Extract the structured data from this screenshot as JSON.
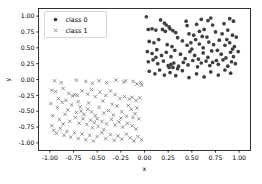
{
  "chart_data": {
    "type": "scatter",
    "title": "",
    "xlabel": "x",
    "ylabel": "y",
    "xlim": [
      -1.12,
      1.12
    ],
    "ylim": [
      -1.12,
      1.12
    ],
    "grid": false,
    "legend_position": "upper left",
    "xticks": [
      -1.0,
      -0.75,
      -0.5,
      -0.25,
      0.0,
      0.25,
      0.5,
      0.75,
      1.0
    ],
    "xticklabels": [
      "-1.00",
      "-0.75",
      "-0.50",
      "-0.25",
      "0.00",
      "0.25",
      "0.50",
      "0.75",
      "1.00"
    ],
    "yticks": [
      -1.0,
      -0.75,
      -0.5,
      -0.25,
      0.0,
      0.25,
      0.5,
      0.75,
      1.0
    ],
    "yticklabels": [
      "-1.00",
      "-0.75",
      "-0.50",
      "-0.25",
      "0.00",
      "0.25",
      "0.50",
      "0.75",
      "1.00"
    ],
    "series": [
      {
        "name": "class 0",
        "marker": "circle",
        "color": "#3f3f3f",
        "size": 12,
        "points": [
          [
            0.02,
            0.99
          ],
          [
            0.17,
            0.94
          ],
          [
            0.21,
            0.89
          ],
          [
            0.23,
            0.86
          ],
          [
            0.26,
            0.83
          ],
          [
            0.44,
            0.92
          ],
          [
            0.6,
            0.95
          ],
          [
            0.67,
            0.93
          ],
          [
            0.7,
            0.97
          ],
          [
            0.9,
            0.96
          ],
          [
            0.94,
            0.92
          ],
          [
            0.04,
            0.79
          ],
          [
            0.08,
            0.8
          ],
          [
            0.12,
            0.78
          ],
          [
            0.19,
            0.79
          ],
          [
            0.22,
            0.76
          ],
          [
            0.27,
            0.8
          ],
          [
            0.3,
            0.77
          ],
          [
            0.33,
            0.74
          ],
          [
            0.47,
            0.72
          ],
          [
            0.52,
            0.7
          ],
          [
            0.58,
            0.76
          ],
          [
            0.63,
            0.79
          ],
          [
            0.66,
            0.67
          ],
          [
            0.75,
            0.75
          ],
          [
            0.82,
            0.72
          ],
          [
            0.88,
            0.78
          ],
          [
            0.93,
            0.7
          ],
          [
            0.97,
            0.67
          ],
          [
            0.05,
            0.6
          ],
          [
            0.1,
            0.58
          ],
          [
            0.15,
            0.63
          ],
          [
            0.24,
            0.55
          ],
          [
            0.29,
            0.52
          ],
          [
            0.35,
            0.66
          ],
          [
            0.4,
            0.61
          ],
          [
            0.45,
            0.54
          ],
          [
            0.49,
            0.58
          ],
          [
            0.54,
            0.63
          ],
          [
            0.58,
            0.56
          ],
          [
            0.62,
            0.5
          ],
          [
            0.68,
            0.59
          ],
          [
            0.73,
            0.55
          ],
          [
            0.79,
            0.62
          ],
          [
            0.85,
            0.54
          ],
          [
            0.9,
            0.58
          ],
          [
            0.95,
            0.52
          ],
          [
            0.99,
            0.44
          ],
          [
            0.03,
            0.44
          ],
          [
            0.08,
            0.41
          ],
          [
            0.13,
            0.47
          ],
          [
            0.18,
            0.38
          ],
          [
            0.23,
            0.43
          ],
          [
            0.28,
            0.36
          ],
          [
            0.32,
            0.46
          ],
          [
            0.38,
            0.4
          ],
          [
            0.43,
            0.33
          ],
          [
            0.48,
            0.44
          ],
          [
            0.53,
            0.38
          ],
          [
            0.57,
            0.32
          ],
          [
            0.62,
            0.42
          ],
          [
            0.67,
            0.35
          ],
          [
            0.71,
            0.45
          ],
          [
            0.76,
            0.3
          ],
          [
            0.81,
            0.4
          ],
          [
            0.86,
            0.34
          ],
          [
            0.91,
            0.43
          ],
          [
            0.94,
            0.36
          ],
          [
            0.04,
            0.28
          ],
          [
            0.09,
            0.31
          ],
          [
            0.14,
            0.25
          ],
          [
            0.2,
            0.29
          ],
          [
            0.25,
            0.22
          ],
          [
            0.26,
            0.19
          ],
          [
            0.28,
            0.24
          ],
          [
            0.31,
            0.26
          ],
          [
            0.36,
            0.21
          ],
          [
            0.41,
            0.27
          ],
          [
            0.46,
            0.23
          ],
          [
            0.51,
            0.3
          ],
          [
            0.56,
            0.2
          ],
          [
            0.6,
            0.26
          ],
          [
            0.65,
            0.29
          ],
          [
            0.69,
            0.22
          ],
          [
            0.72,
            0.27
          ],
          [
            0.78,
            0.24
          ],
          [
            0.83,
            0.31
          ],
          [
            0.88,
            0.21
          ],
          [
            0.92,
            0.28
          ],
          [
            0.96,
            0.25
          ],
          [
            0.05,
            0.13
          ],
          [
            0.11,
            0.09
          ],
          [
            0.16,
            0.15
          ],
          [
            0.21,
            0.07
          ],
          [
            0.27,
            0.11
          ],
          [
            0.33,
            0.06
          ],
          [
            0.4,
            0.14
          ],
          [
            0.47,
            0.03
          ],
          [
            0.55,
            0.09
          ],
          [
            0.63,
            0.04
          ],
          [
            0.7,
            0.12
          ],
          [
            0.78,
            0.07
          ],
          [
            0.85,
            0.15
          ],
          [
            0.91,
            0.1
          ],
          [
            0.3,
            0.19
          ],
          [
            0.35,
            0.17
          ],
          [
            0.5,
            0.48
          ],
          [
            0.61,
            0.68
          ],
          [
            0.77,
            0.46
          ],
          [
            0.87,
            0.63
          ],
          [
            0.93,
            0.48
          ],
          [
            0.12,
            0.35
          ],
          [
            0.45,
            0.85
          ],
          [
            0.55,
            0.87
          ],
          [
            0.84,
            0.88
          ],
          [
            0.72,
            0.86
          ]
        ]
      },
      {
        "name": "class 1",
        "marker": "x",
        "color": "#6e6e6e",
        "size": 11,
        "points": [
          [
            -0.95,
            -0.02
          ],
          [
            -0.88,
            -0.05
          ],
          [
            -0.72,
            -0.01
          ],
          [
            -0.62,
            -0.03
          ],
          [
            -0.55,
            -0.06
          ],
          [
            -0.48,
            -0.02
          ],
          [
            -0.4,
            -0.05
          ],
          [
            -0.3,
            -0.01
          ],
          [
            -0.22,
            -0.04
          ],
          [
            -0.2,
            -0.02
          ],
          [
            -0.12,
            -0.03
          ],
          [
            -0.08,
            -0.07
          ],
          [
            -0.04,
            -0.05
          ],
          [
            -0.03,
            -0.09
          ],
          [
            -0.98,
            -0.17
          ],
          [
            -0.94,
            -0.19
          ],
          [
            -0.86,
            -0.14
          ],
          [
            -0.8,
            -0.22
          ],
          [
            -0.76,
            -0.26
          ],
          [
            -0.74,
            -0.24
          ],
          [
            -0.71,
            -0.25
          ],
          [
            -0.66,
            -0.18
          ],
          [
            -0.6,
            -0.23
          ],
          [
            -0.56,
            -0.16
          ],
          [
            -0.52,
            -0.27
          ],
          [
            -0.47,
            -0.2
          ],
          [
            -0.41,
            -0.25
          ],
          [
            -0.36,
            -0.18
          ],
          [
            -0.31,
            -0.24
          ],
          [
            -0.26,
            -0.3
          ],
          [
            -0.21,
            -0.27
          ],
          [
            -0.16,
            -0.31
          ],
          [
            -0.13,
            -0.28
          ],
          [
            -0.09,
            -0.33
          ],
          [
            -0.05,
            -0.29
          ],
          [
            -0.99,
            -0.38
          ],
          [
            -0.92,
            -0.44
          ],
          [
            -0.87,
            -0.36
          ],
          [
            -0.81,
            -0.48
          ],
          [
            -0.77,
            -0.4
          ],
          [
            -0.72,
            -0.52
          ],
          [
            -0.68,
            -0.43
          ],
          [
            -0.64,
            -0.55
          ],
          [
            -0.6,
            -0.47
          ],
          [
            -0.56,
            -0.51
          ],
          [
            -0.52,
            -0.57
          ],
          [
            -0.48,
            -0.44
          ],
          [
            -0.43,
            -0.53
          ],
          [
            -0.38,
            -0.49
          ],
          [
            -0.33,
            -0.56
          ],
          [
            -0.29,
            -0.42
          ],
          [
            -0.24,
            -0.51
          ],
          [
            -0.19,
            -0.58
          ],
          [
            -0.14,
            -0.47
          ],
          [
            -0.1,
            -0.54
          ],
          [
            -0.06,
            -0.62
          ],
          [
            -0.97,
            -0.57
          ],
          [
            -0.9,
            -0.63
          ],
          [
            -0.84,
            -0.55
          ],
          [
            -0.79,
            -0.66
          ],
          [
            -0.73,
            -0.6
          ],
          [
            -0.69,
            -0.69
          ],
          [
            -0.65,
            -0.62
          ],
          [
            -0.61,
            -0.71
          ],
          [
            -0.57,
            -0.64
          ],
          [
            -0.53,
            -0.68
          ],
          [
            -0.49,
            -0.74
          ],
          [
            -0.45,
            -0.66
          ],
          [
            -0.4,
            -0.7
          ],
          [
            -0.35,
            -0.63
          ],
          [
            -0.31,
            -0.72
          ],
          [
            -0.27,
            -0.67
          ],
          [
            -0.23,
            -0.75
          ],
          [
            -0.18,
            -0.69
          ],
          [
            -0.13,
            -0.73
          ],
          [
            -0.09,
            -0.78
          ],
          [
            -0.96,
            -0.8
          ],
          [
            -0.93,
            -0.85
          ],
          [
            -0.89,
            -0.77
          ],
          [
            -0.85,
            -0.88
          ],
          [
            -0.82,
            -0.82
          ],
          [
            -0.78,
            -0.91
          ],
          [
            -0.74,
            -0.84
          ],
          [
            -0.7,
            -0.93
          ],
          [
            -0.66,
            -0.86
          ],
          [
            -0.62,
            -0.95
          ],
          [
            -0.58,
            -0.88
          ],
          [
            -0.54,
            -0.97
          ],
          [
            -0.5,
            -0.9
          ],
          [
            -0.45,
            -0.84
          ],
          [
            -0.41,
            -0.93
          ],
          [
            -0.36,
            -0.87
          ],
          [
            -0.32,
            -0.96
          ],
          [
            -0.28,
            -0.89
          ],
          [
            -0.24,
            -0.94
          ],
          [
            -0.19,
            -0.86
          ],
          [
            -0.15,
            -0.92
          ],
          [
            -0.11,
            -0.97
          ],
          [
            -0.07,
            -0.9
          ],
          [
            -0.03,
            -0.95
          ],
          [
            -0.91,
            -0.3
          ],
          [
            -0.83,
            -0.33
          ],
          [
            -0.7,
            -0.35
          ],
          [
            -0.59,
            -0.37
          ],
          [
            -0.44,
            -0.34
          ],
          [
            -0.34,
            -0.39
          ],
          [
            -0.17,
            -0.41
          ],
          [
            -0.08,
            -0.45
          ],
          [
            -0.25,
            -0.61
          ],
          [
            -0.12,
            -0.6
          ],
          [
            -0.5,
            -0.62
          ],
          [
            -0.67,
            -0.5
          ],
          [
            -0.86,
            -0.7
          ],
          [
            -0.98,
            -0.73
          ],
          [
            -0.43,
            -0.79
          ],
          [
            -0.55,
            -0.76
          ]
        ]
      }
    ]
  },
  "legend": {
    "entries": [
      {
        "label": "class 0",
        "marker": "circle"
      },
      {
        "label": "class 1",
        "marker": "x"
      }
    ]
  }
}
